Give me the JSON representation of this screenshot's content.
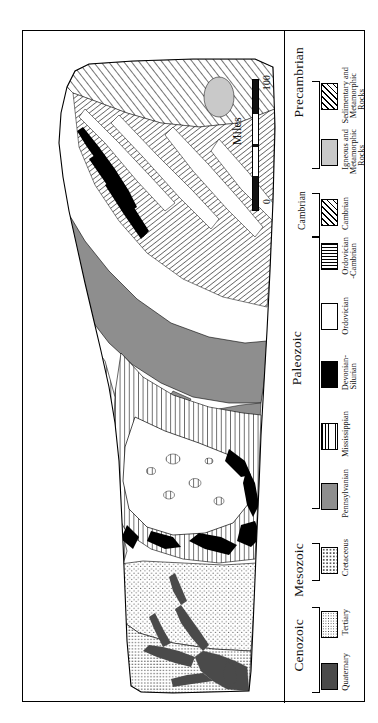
{
  "figure": {
    "type": "geologic-map",
    "orientation": "rotated-90-counterclockwise",
    "frame_border_color": "#000000",
    "background_color": "#ffffff"
  },
  "scale_bar": {
    "title": "Miles",
    "min_label": "0",
    "max_label": "100",
    "units": "miles",
    "range": [
      0,
      100
    ]
  },
  "legend": {
    "eras": [
      {
        "name": "Precambrian",
        "units": [
          {
            "label_line1": "Sedimentary and",
            "label_line2": "Metamorphic",
            "label_line3": "Rocks",
            "pattern": "diagonal-hatch",
            "color": "#ffffff"
          },
          {
            "label_line1": "Igneous and",
            "label_line2": "Metamorphic",
            "label_line3": "Rocks",
            "pattern": "solid-light-gray",
            "color": "#c9c9c9"
          }
        ]
      },
      {
        "name": "Cambrian",
        "units": [
          {
            "label_line1": "Cambrian",
            "label_line2": "",
            "label_line3": "",
            "pattern": "diagonal-hatch",
            "color": "#ffffff"
          }
        ]
      },
      {
        "name": "Paleozoic",
        "units": [
          {
            "label_line1": "Ordovician",
            "label_line2": "-Cambrian",
            "label_line3": "",
            "pattern": "horizontal-lines",
            "color": "#ffffff"
          },
          {
            "label_line1": "Ordovician",
            "label_line2": "",
            "label_line3": "",
            "pattern": "white",
            "color": "#ffffff"
          },
          {
            "label_line1": "Devonian-",
            "label_line2": "Silurian",
            "label_line3": "",
            "pattern": "solid-black",
            "color": "#000000"
          },
          {
            "label_line1": "Mississippian",
            "label_line2": "",
            "label_line3": "",
            "pattern": "vertical-lines",
            "color": "#ffffff"
          },
          {
            "label_line1": "Pennsylvanian",
            "label_line2": "",
            "label_line3": "",
            "pattern": "solid-medium-gray",
            "color": "#8e8e8e"
          }
        ]
      },
      {
        "name": "Mesozoic",
        "units": [
          {
            "label_line1": "Cretaceous",
            "label_line2": "",
            "label_line3": "",
            "pattern": "sparse-stipple",
            "color": "#ffffff"
          }
        ]
      },
      {
        "name": "Cenozoic",
        "units": [
          {
            "label_line1": "Tertiary",
            "label_line2": "",
            "label_line3": "",
            "pattern": "dense-stipple",
            "color": "#ffffff"
          },
          {
            "label_line1": "Quaternary",
            "label_line2": "",
            "label_line3": "",
            "pattern": "solid-dark-gray",
            "color": "#4a4a4a"
          }
        ]
      }
    ]
  }
}
